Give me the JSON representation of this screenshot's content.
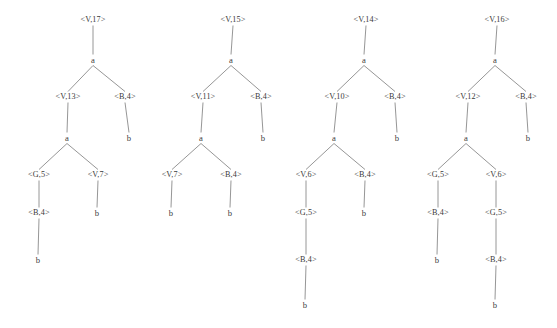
{
  "figure": {
    "title": "",
    "background_color": "#ffffff",
    "edge_color": "#8a8a8a",
    "text_color": "#3a3a3a",
    "width": 557,
    "height": 328
  },
  "chart_data": {
    "type": "diagram",
    "diagram_kind": "derivation-trees",
    "title": "",
    "xlabel": "",
    "ylabel": "",
    "tree_count": 4,
    "trees": [
      {
        "index": 0,
        "root_label": "<V,17>",
        "nodes": [
          {
            "id": "t0n0",
            "label": "<V,17>",
            "x": 93,
            "y": 20,
            "kind": "nonterminal",
            "depth": 0
          },
          {
            "id": "t0n1",
            "label": "a",
            "x": 93,
            "y": 60,
            "kind": "terminal",
            "depth": 1
          },
          {
            "id": "t0n2",
            "label": "<V,13>",
            "x": 68,
            "y": 97,
            "kind": "nonterminal",
            "depth": 2
          },
          {
            "id": "t0n3",
            "label": "<B,4>",
            "x": 125,
            "y": 97,
            "kind": "nonterminal",
            "depth": 2
          },
          {
            "id": "t0n4",
            "label": "a",
            "x": 67,
            "y": 138,
            "kind": "terminal",
            "depth": 3
          },
          {
            "id": "t0n5",
            "label": "b",
            "x": 129,
            "y": 138,
            "kind": "terminal",
            "depth": 3
          },
          {
            "id": "t0n6",
            "label": "<G,5>",
            "x": 39,
            "y": 175,
            "kind": "nonterminal",
            "depth": 4
          },
          {
            "id": "t0n7",
            "label": "<V,7>",
            "x": 98,
            "y": 175,
            "kind": "nonterminal",
            "depth": 4
          },
          {
            "id": "t0n8",
            "label": "<B,4>",
            "x": 39,
            "y": 213,
            "kind": "nonterminal",
            "depth": 5
          },
          {
            "id": "t0n9",
            "label": "b",
            "x": 97,
            "y": 213,
            "kind": "terminal",
            "depth": 5
          },
          {
            "id": "t0n10",
            "label": "b",
            "x": 38,
            "y": 260,
            "kind": "terminal",
            "depth": 6
          }
        ],
        "edges": [
          [
            "t0n0",
            "t0n1"
          ],
          [
            "t0n1",
            "t0n2"
          ],
          [
            "t0n1",
            "t0n3"
          ],
          [
            "t0n2",
            "t0n4"
          ],
          [
            "t0n3",
            "t0n5"
          ],
          [
            "t0n4",
            "t0n6"
          ],
          [
            "t0n4",
            "t0n7"
          ],
          [
            "t0n6",
            "t0n8"
          ],
          [
            "t0n7",
            "t0n9"
          ],
          [
            "t0n8",
            "t0n10"
          ]
        ]
      },
      {
        "index": 1,
        "root_label": "<V,15>",
        "nodes": [
          {
            "id": "t1n0",
            "label": "<V,15>",
            "x": 233,
            "y": 20,
            "kind": "nonterminal",
            "depth": 0
          },
          {
            "id": "t1n1",
            "label": "a",
            "x": 231,
            "y": 60,
            "kind": "terminal",
            "depth": 1
          },
          {
            "id": "t1n2",
            "label": "<V,11>",
            "x": 203,
            "y": 97,
            "kind": "nonterminal",
            "depth": 2
          },
          {
            "id": "t1n3",
            "label": "<B,4>",
            "x": 261,
            "y": 97,
            "kind": "nonterminal",
            "depth": 2
          },
          {
            "id": "t1n4",
            "label": "a",
            "x": 201,
            "y": 138,
            "kind": "terminal",
            "depth": 3
          },
          {
            "id": "t1n5",
            "label": "b",
            "x": 263,
            "y": 138,
            "kind": "terminal",
            "depth": 3
          },
          {
            "id": "t1n6",
            "label": "<V,7>",
            "x": 172,
            "y": 175,
            "kind": "nonterminal",
            "depth": 4
          },
          {
            "id": "t1n7",
            "label": "<V,7>",
            "x": 172,
            "y": 175,
            "kind": "hidden",
            "depth": 4
          },
          {
            "id": "t1n8",
            "label": "<B,4>",
            "x": 231,
            "y": 175,
            "kind": "nonterminal",
            "depth": 4
          },
          {
            "id": "t1n9",
            "label": "b",
            "x": 171,
            "y": 213,
            "kind": "terminal",
            "depth": 5
          },
          {
            "id": "t1n10",
            "label": "b",
            "x": 230,
            "y": 213,
            "kind": "terminal",
            "depth": 5
          }
        ],
        "edges": [
          [
            "t1n0",
            "t1n1"
          ],
          [
            "t1n1",
            "t1n2"
          ],
          [
            "t1n1",
            "t1n3"
          ],
          [
            "t1n2",
            "t1n4"
          ],
          [
            "t1n3",
            "t1n5"
          ],
          [
            "t1n4",
            "t1n6"
          ],
          [
            "t1n4",
            "t1n8"
          ],
          [
            "t1n6",
            "t1n9"
          ],
          [
            "t1n8",
            "t1n10"
          ]
        ]
      },
      {
        "index": 2,
        "root_label": "<V,14>",
        "nodes": [
          {
            "id": "t2n0",
            "label": "<V,14>",
            "x": 366,
            "y": 20,
            "kind": "nonterminal",
            "depth": 0
          },
          {
            "id": "t2n1",
            "label": "a",
            "x": 364,
            "y": 60,
            "kind": "terminal",
            "depth": 1
          },
          {
            "id": "t2n2",
            "label": "<V,10>",
            "x": 337,
            "y": 97,
            "kind": "nonterminal",
            "depth": 2
          },
          {
            "id": "t2n3",
            "label": "<B,4>",
            "x": 395,
            "y": 97,
            "kind": "nonterminal",
            "depth": 2
          },
          {
            "id": "t2n4",
            "label": "a",
            "x": 334,
            "y": 138,
            "kind": "terminal",
            "depth": 3
          },
          {
            "id": "t2n5",
            "label": "b",
            "x": 397,
            "y": 138,
            "kind": "terminal",
            "depth": 3
          },
          {
            "id": "t2n6",
            "label": "<V,6>",
            "x": 306,
            "y": 175,
            "kind": "nonterminal",
            "depth": 4
          },
          {
            "id": "t2n7",
            "label": "<B,4>",
            "x": 365,
            "y": 175,
            "kind": "nonterminal",
            "depth": 4
          },
          {
            "id": "t2n8",
            "label": "<G,5>",
            "x": 306,
            "y": 213,
            "kind": "nonterminal",
            "depth": 5
          },
          {
            "id": "t2n9",
            "label": "b",
            "x": 364,
            "y": 213,
            "kind": "terminal",
            "depth": 5
          },
          {
            "id": "t2n10",
            "label": "<B,4>",
            "x": 306,
            "y": 260,
            "kind": "nonterminal",
            "depth": 6
          },
          {
            "id": "t2n11",
            "label": "b",
            "x": 305,
            "y": 305,
            "kind": "terminal",
            "depth": 7
          }
        ],
        "edges": [
          [
            "t2n0",
            "t2n1"
          ],
          [
            "t2n1",
            "t2n2"
          ],
          [
            "t2n1",
            "t2n3"
          ],
          [
            "t2n2",
            "t2n4"
          ],
          [
            "t2n3",
            "t2n5"
          ],
          [
            "t2n4",
            "t2n6"
          ],
          [
            "t2n4",
            "t2n7"
          ],
          [
            "t2n6",
            "t2n8"
          ],
          [
            "t2n7",
            "t2n9"
          ],
          [
            "t2n8",
            "t2n10"
          ],
          [
            "t2n10",
            "t2n11"
          ]
        ]
      },
      {
        "index": 3,
        "root_label": "<V,16>",
        "nodes": [
          {
            "id": "t3n0",
            "label": "<V,16>",
            "x": 497,
            "y": 20,
            "kind": "nonterminal",
            "depth": 0
          },
          {
            "id": "t3n1",
            "label": "a",
            "x": 495,
            "y": 60,
            "kind": "terminal",
            "depth": 1
          },
          {
            "id": "t3n2",
            "label": "<V,12>",
            "x": 468,
            "y": 97,
            "kind": "nonterminal",
            "depth": 2
          },
          {
            "id": "t3n3",
            "label": "<B,4>",
            "x": 526,
            "y": 97,
            "kind": "nonterminal",
            "depth": 2
          },
          {
            "id": "t3n4",
            "label": "a",
            "x": 466,
            "y": 138,
            "kind": "terminal",
            "depth": 3
          },
          {
            "id": "t3n5",
            "label": "b",
            "x": 528,
            "y": 138,
            "kind": "terminal",
            "depth": 3
          },
          {
            "id": "t3n6",
            "label": "<G,5>",
            "x": 438,
            "y": 175,
            "kind": "nonterminal",
            "depth": 4
          },
          {
            "id": "t3n7",
            "label": "<V,6>",
            "x": 496,
            "y": 175,
            "kind": "nonterminal",
            "depth": 4
          },
          {
            "id": "t3n8",
            "label": "<B,4>",
            "x": 438,
            "y": 213,
            "kind": "nonterminal",
            "depth": 5
          },
          {
            "id": "t3n9",
            "label": "<G,5>",
            "x": 496,
            "y": 213,
            "kind": "nonterminal",
            "depth": 5
          },
          {
            "id": "t3n10",
            "label": "b",
            "x": 437,
            "y": 260,
            "kind": "terminal",
            "depth": 6
          },
          {
            "id": "t3n11",
            "label": "<B,4>",
            "x": 496,
            "y": 260,
            "kind": "nonterminal",
            "depth": 6
          },
          {
            "id": "t3n12",
            "label": "b",
            "x": 495,
            "y": 305,
            "kind": "terminal",
            "depth": 7
          }
        ],
        "edges": [
          [
            "t3n0",
            "t3n1"
          ],
          [
            "t3n1",
            "t3n2"
          ],
          [
            "t3n1",
            "t3n3"
          ],
          [
            "t3n2",
            "t3n4"
          ],
          [
            "t3n3",
            "t3n5"
          ],
          [
            "t3n4",
            "t3n6"
          ],
          [
            "t3n4",
            "t3n7"
          ],
          [
            "t3n6",
            "t3n8"
          ],
          [
            "t3n7",
            "t3n9"
          ],
          [
            "t3n8",
            "t3n10"
          ],
          [
            "t3n9",
            "t3n11"
          ],
          [
            "t3n11",
            "t3n12"
          ]
        ]
      }
    ]
  }
}
